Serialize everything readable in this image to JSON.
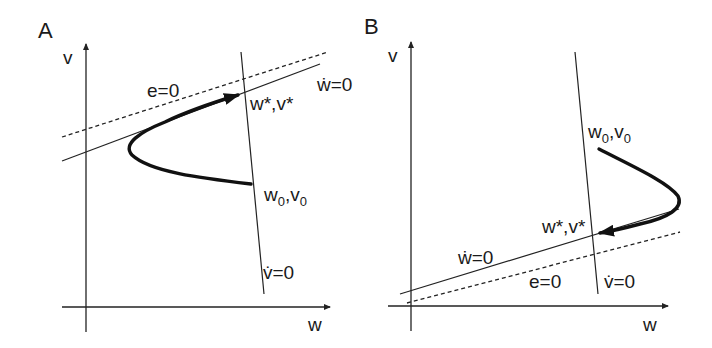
{
  "panels": [
    {
      "id": "A",
      "letter": "A",
      "axes": {
        "x_label": "w",
        "y_label": "v"
      },
      "labels": {
        "e_zero": "e=0",
        "w_dot_zero": "ẇ=0",
        "v_dot_zero": "v̇=0",
        "fixed_point": "w*,v*",
        "initial_w": "w",
        "initial_v": "v",
        "subscript": "0"
      }
    },
    {
      "id": "B",
      "letter": "B",
      "axes": {
        "x_label": "w",
        "y_label": "v"
      },
      "labels": {
        "e_zero": "e=0",
        "w_dot_zero": "ẇ=0",
        "v_dot_zero": "v̇=0",
        "fixed_point": "w*,v*",
        "initial_w": "w",
        "initial_v": "v",
        "subscript": "0"
      }
    }
  ],
  "colors": {
    "ink": "#1a1a1a",
    "background": "#ffffff"
  }
}
